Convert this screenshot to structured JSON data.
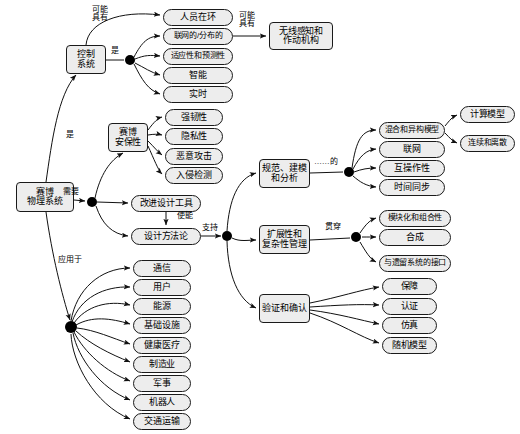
{
  "diagram": {
    "type": "concept-map",
    "style": {
      "node_fill": "#ededed",
      "node_stroke": "#1a1a1a",
      "edge_color": "#1a1a1a",
      "hub_color": "#000000",
      "background": "#ffffff"
    },
    "root": {
      "id": "cps",
      "label": "赛博\n物理系统"
    },
    "nodes": [
      {
        "id": "cps",
        "label": "赛博\n物理系统",
        "x": 16,
        "y": 182,
        "w": 58,
        "h": 30,
        "shape": "rect",
        "fs": 9
      },
      {
        "id": "control",
        "label": "控制\n系统",
        "x": 66,
        "y": 45,
        "w": 40,
        "h": 29,
        "shape": "rect",
        "fs": 9
      },
      {
        "id": "human",
        "label": "人员在环",
        "x": 163,
        "y": 9,
        "w": 70,
        "h": 17,
        "shape": "round",
        "fs": 9
      },
      {
        "id": "networked",
        "label": "联网的/分布的",
        "x": 163,
        "y": 28,
        "w": 70,
        "h": 17,
        "shape": "round",
        "fs": 8
      },
      {
        "id": "adaptive",
        "label": "适应性和预测性",
        "x": 163,
        "y": 48,
        "w": 70,
        "h": 17,
        "shape": "round",
        "fs": 8
      },
      {
        "id": "intelligent",
        "label": "智能",
        "x": 163,
        "y": 67,
        "w": 70,
        "h": 17,
        "shape": "round",
        "fs": 9
      },
      {
        "id": "realtime",
        "label": "实时",
        "x": 163,
        "y": 86,
        "w": 70,
        "h": 17,
        "shape": "round",
        "fs": 9
      },
      {
        "id": "wireless",
        "label": "无线感知和\n作动机构",
        "x": 269,
        "y": 22,
        "w": 64,
        "h": 28,
        "shape": "rect",
        "fs": 9
      },
      {
        "id": "security",
        "label": "赛博\n安保性",
        "x": 108,
        "y": 123,
        "w": 40,
        "h": 29,
        "shape": "rect",
        "fs": 9
      },
      {
        "id": "robust",
        "label": "强韧性",
        "x": 165,
        "y": 109,
        "w": 58,
        "h": 17,
        "shape": "round",
        "fs": 9
      },
      {
        "id": "privacy",
        "label": "隐私性",
        "x": 165,
        "y": 128,
        "w": 58,
        "h": 17,
        "shape": "round",
        "fs": 9
      },
      {
        "id": "attack",
        "label": "恶意攻击",
        "x": 165,
        "y": 148,
        "w": 58,
        "h": 17,
        "shape": "round",
        "fs": 9
      },
      {
        "id": "intrusion",
        "label": "入侵检测",
        "x": 165,
        "y": 167,
        "w": 58,
        "h": 17,
        "shape": "round",
        "fs": 9
      },
      {
        "id": "tools",
        "label": "改进设计工具",
        "x": 131,
        "y": 195,
        "w": 70,
        "h": 17,
        "shape": "round",
        "fs": 9
      },
      {
        "id": "methodology",
        "label": "设计方法论",
        "x": 131,
        "y": 228,
        "w": 70,
        "h": 17,
        "shape": "round",
        "fs": 9
      },
      {
        "id": "spec",
        "label": "规范、建模\n和分析",
        "x": 259,
        "y": 159,
        "w": 51,
        "h": 29,
        "shape": "rect",
        "fs": 9
      },
      {
        "id": "scalability",
        "label": "扩展性和\n复杂性管理",
        "x": 259,
        "y": 225,
        "w": 51,
        "h": 29,
        "shape": "rect",
        "fs": 9
      },
      {
        "id": "verification",
        "label": "验证和确认",
        "x": 259,
        "y": 294,
        "w": 51,
        "h": 29,
        "shape": "rect",
        "fs": 9
      },
      {
        "id": "hybrid",
        "label": "混合和异构模型",
        "x": 379,
        "y": 122,
        "w": 66,
        "h": 17,
        "shape": "round",
        "fs": 8
      },
      {
        "id": "net2",
        "label": "联网",
        "x": 379,
        "y": 141,
        "w": 66,
        "h": 17,
        "shape": "round",
        "fs": 9
      },
      {
        "id": "interop",
        "label": "互操作性",
        "x": 379,
        "y": 160,
        "w": 66,
        "h": 17,
        "shape": "round",
        "fs": 9
      },
      {
        "id": "timesync",
        "label": "时间同步",
        "x": 379,
        "y": 179,
        "w": 66,
        "h": 17,
        "shape": "round",
        "fs": 9
      },
      {
        "id": "compmodel",
        "label": "计算模型",
        "x": 460,
        "y": 106,
        "w": 55,
        "h": 17,
        "shape": "round",
        "fs": 9
      },
      {
        "id": "contdisc",
        "label": "连续和离散",
        "x": 460,
        "y": 135,
        "w": 55,
        "h": 17,
        "shape": "round",
        "fs": 8
      },
      {
        "id": "modular",
        "label": "模块化和组合性",
        "x": 379,
        "y": 210,
        "w": 72,
        "h": 17,
        "shape": "round",
        "fs": 8
      },
      {
        "id": "synthesis",
        "label": "合成",
        "x": 379,
        "y": 229,
        "w": 72,
        "h": 17,
        "shape": "round",
        "fs": 9
      },
      {
        "id": "legacy",
        "label": "与遗留系统的接口",
        "x": 379,
        "y": 255,
        "w": 72,
        "h": 17,
        "shape": "round",
        "fs": 8
      },
      {
        "id": "assurance",
        "label": "保障",
        "x": 382,
        "y": 278,
        "w": 55,
        "h": 17,
        "shape": "round",
        "fs": 9
      },
      {
        "id": "certify",
        "label": "认证",
        "x": 382,
        "y": 298,
        "w": 55,
        "h": 17,
        "shape": "round",
        "fs": 9
      },
      {
        "id": "simulation",
        "label": "仿真",
        "x": 382,
        "y": 317,
        "w": 55,
        "h": 17,
        "shape": "round",
        "fs": 9
      },
      {
        "id": "stochastic",
        "label": "随机模型",
        "x": 382,
        "y": 337,
        "w": 55,
        "h": 17,
        "shape": "round",
        "fs": 9
      },
      {
        "id": "comm",
        "label": "通信",
        "x": 133,
        "y": 260,
        "w": 58,
        "h": 17,
        "shape": "round",
        "fs": 9
      },
      {
        "id": "user",
        "label": "用户",
        "x": 133,
        "y": 279,
        "w": 58,
        "h": 17,
        "shape": "round",
        "fs": 9
      },
      {
        "id": "energy",
        "label": "能源",
        "x": 133,
        "y": 298,
        "w": 58,
        "h": 17,
        "shape": "round",
        "fs": 9
      },
      {
        "id": "infra",
        "label": "基础设施",
        "x": 133,
        "y": 317,
        "w": 58,
        "h": 17,
        "shape": "round",
        "fs": 9
      },
      {
        "id": "health",
        "label": "健康医疗",
        "x": 133,
        "y": 337,
        "w": 58,
        "h": 17,
        "shape": "round",
        "fs": 9
      },
      {
        "id": "manufact",
        "label": "制造业",
        "x": 133,
        "y": 356,
        "w": 58,
        "h": 17,
        "shape": "round",
        "fs": 9
      },
      {
        "id": "military",
        "label": "军事",
        "x": 133,
        "y": 375,
        "w": 58,
        "h": 17,
        "shape": "round",
        "fs": 9
      },
      {
        "id": "robotics",
        "label": "机器人",
        "x": 133,
        "y": 394,
        "w": 58,
        "h": 17,
        "shape": "round",
        "fs": 9
      },
      {
        "id": "transport",
        "label": "交通运输",
        "x": 133,
        "y": 413,
        "w": 58,
        "h": 17,
        "shape": "round",
        "fs": 9
      }
    ],
    "hubs": [
      {
        "id": "hub-control",
        "cx": 130,
        "cy": 60,
        "r": 5
      },
      {
        "id": "hub-needs",
        "cx": 92,
        "cy": 202,
        "r": 5
      },
      {
        "id": "hub-support",
        "cx": 227,
        "cy": 236,
        "r": 5
      },
      {
        "id": "hub-spec",
        "cx": 349,
        "cy": 172,
        "r": 5
      },
      {
        "id": "hub-scale",
        "cx": 356,
        "cy": 237,
        "r": 5
      },
      {
        "id": "hub-apply",
        "cx": 71,
        "cy": 327,
        "r": 6
      }
    ],
    "edge_labels": [
      {
        "id": "el-may-have-1",
        "text": "可能\n具有",
        "x": 92,
        "y": 6,
        "fs": 8
      },
      {
        "id": "el-is-control",
        "text": "是",
        "x": 111,
        "y": 47,
        "fs": 8
      },
      {
        "id": "el-may-have-2",
        "text": "可能\n具有",
        "x": 239,
        "y": 12,
        "fs": 8
      },
      {
        "id": "el-is-root",
        "text": "是",
        "x": 66,
        "y": 131,
        "fs": 8
      },
      {
        "id": "el-needs",
        "text": "需要",
        "x": 63,
        "y": 188,
        "fs": 8
      },
      {
        "id": "el-enables",
        "text": "使能",
        "x": 177,
        "y": 212,
        "fs": 8
      },
      {
        "id": "el-supports",
        "text": "支持",
        "x": 202,
        "y": 224,
        "fs": 8
      },
      {
        "id": "el-applied-to",
        "text": "应用于",
        "x": 58,
        "y": 256,
        "fs": 8
      },
      {
        "id": "el-of",
        "text": "……的",
        "x": 314,
        "y": 158,
        "fs": 8
      },
      {
        "id": "el-through",
        "text": "贯穿",
        "x": 325,
        "y": 223,
        "fs": 8
      }
    ],
    "relations": [
      {
        "from": "cps",
        "to": "control",
        "label": "是"
      },
      {
        "from": "cps",
        "to": "hub-needs",
        "label": "需要"
      },
      {
        "from": "cps",
        "to": "hub-apply",
        "label": "应用于"
      },
      {
        "from": "control",
        "to": "human",
        "label": "可能具有"
      },
      {
        "from": "control",
        "to": "hub-control",
        "label": "是"
      },
      {
        "from": "hub-control",
        "to": "networked",
        "label": ""
      },
      {
        "from": "hub-control",
        "to": "adaptive",
        "label": ""
      },
      {
        "from": "hub-control",
        "to": "intelligent",
        "label": ""
      },
      {
        "from": "hub-control",
        "to": "realtime",
        "label": ""
      },
      {
        "from": "networked",
        "to": "wireless",
        "label": "可能具有"
      },
      {
        "from": "hub-needs",
        "to": "security",
        "label": ""
      },
      {
        "from": "hub-needs",
        "to": "tools",
        "label": ""
      },
      {
        "from": "hub-needs",
        "to": "methodology",
        "label": ""
      },
      {
        "from": "security",
        "to": "robust",
        "label": ""
      },
      {
        "from": "security",
        "to": "privacy",
        "label": ""
      },
      {
        "from": "security",
        "to": "attack",
        "label": ""
      },
      {
        "from": "security",
        "to": "intrusion",
        "label": ""
      },
      {
        "from": "tools",
        "to": "methodology",
        "label": "使能"
      },
      {
        "from": "methodology",
        "to": "hub-support",
        "label": "支持"
      },
      {
        "from": "hub-support",
        "to": "spec",
        "label": ""
      },
      {
        "from": "hub-support",
        "to": "scalability",
        "label": ""
      },
      {
        "from": "hub-support",
        "to": "verification",
        "label": ""
      },
      {
        "from": "spec",
        "to": "hub-spec",
        "label": "……的"
      },
      {
        "from": "hub-spec",
        "to": "hybrid",
        "label": ""
      },
      {
        "from": "hub-spec",
        "to": "net2",
        "label": ""
      },
      {
        "from": "hub-spec",
        "to": "interop",
        "label": ""
      },
      {
        "from": "hub-spec",
        "to": "timesync",
        "label": ""
      },
      {
        "from": "hybrid",
        "to": "compmodel",
        "label": ""
      },
      {
        "from": "hybrid",
        "to": "contdisc",
        "label": ""
      },
      {
        "from": "scalability",
        "to": "hub-scale",
        "label": "贯穿"
      },
      {
        "from": "hub-scale",
        "to": "modular",
        "label": ""
      },
      {
        "from": "hub-scale",
        "to": "synthesis",
        "label": ""
      },
      {
        "from": "hub-scale",
        "to": "legacy",
        "label": ""
      },
      {
        "from": "verification",
        "to": "assurance",
        "label": ""
      },
      {
        "from": "verification",
        "to": "certify",
        "label": ""
      },
      {
        "from": "verification",
        "to": "simulation",
        "label": ""
      },
      {
        "from": "verification",
        "to": "stochastic",
        "label": ""
      },
      {
        "from": "hub-apply",
        "to": "comm",
        "label": ""
      },
      {
        "from": "hub-apply",
        "to": "user",
        "label": ""
      },
      {
        "from": "hub-apply",
        "to": "energy",
        "label": ""
      },
      {
        "from": "hub-apply",
        "to": "infra",
        "label": ""
      },
      {
        "from": "hub-apply",
        "to": "health",
        "label": ""
      },
      {
        "from": "hub-apply",
        "to": "manufact",
        "label": ""
      },
      {
        "from": "hub-apply",
        "to": "military",
        "label": ""
      },
      {
        "from": "hub-apply",
        "to": "robotics",
        "label": ""
      },
      {
        "from": "hub-apply",
        "to": "transport",
        "label": ""
      }
    ],
    "edge_paths": [
      {
        "id": "p-cps-control",
        "d": "M 46,182 C 52,140 58,95 76,75",
        "arrow": true
      },
      {
        "id": "p-cps-hubneeds",
        "d": "M 74,200 L 85,201",
        "arrow": true
      },
      {
        "id": "p-cps-hubapply",
        "d": "M 46,212 C 52,255 62,295 70,320",
        "arrow": true
      },
      {
        "id": "p-ctrl-human",
        "d": "M 86,45 C 88,22 120,10 160,15",
        "arrow": true
      },
      {
        "id": "p-ctrl-hub",
        "d": "M 106,60 L 124,60",
        "arrow": false
      },
      {
        "id": "p-hub-net",
        "d": "M 134,57 C 142,42 148,36 160,36",
        "arrow": true
      },
      {
        "id": "p-hub-adap",
        "d": "M 135,59 C 145,55 150,55 160,56",
        "arrow": true
      },
      {
        "id": "p-hub-intl",
        "d": "M 135,63 C 145,68 150,72 160,75",
        "arrow": true
      },
      {
        "id": "p-hub-rt",
        "d": "M 134,64 C 142,80 148,90 160,94",
        "arrow": true
      },
      {
        "id": "p-net-wireless",
        "d": "M 233,36 L 266,36",
        "arrow": true
      },
      {
        "id": "p-hubn-sec",
        "d": "M 95,198 C 100,175 110,160 123,153",
        "arrow": true
      },
      {
        "id": "p-hubn-tools",
        "d": "M 97,202 L 128,203",
        "arrow": true
      },
      {
        "id": "p-hubn-meth",
        "d": "M 96,206 C 102,224 112,234 128,236",
        "arrow": true
      },
      {
        "id": "p-sec-rob",
        "d": "M 148,130 C 154,122 158,118 162,117",
        "arrow": true
      },
      {
        "id": "p-sec-pri",
        "d": "M 148,135 C 154,134 158,134 162,135",
        "arrow": true
      },
      {
        "id": "p-sec-att",
        "d": "M 148,141 C 154,147 158,152 162,155",
        "arrow": true
      },
      {
        "id": "p-sec-int",
        "d": "M 148,146 C 154,159 158,170 162,174",
        "arrow": true
      },
      {
        "id": "p-tools-meth",
        "d": "M 166,212 L 166,225",
        "arrow": true
      },
      {
        "id": "p-meth-hubs",
        "d": "M 201,236 L 221,236",
        "arrow": true
      },
      {
        "id": "p-hubs-spec",
        "d": "M 227,231 C 229,200 238,178 256,173",
        "arrow": true
      },
      {
        "id": "p-hubs-scale",
        "d": "M 232,238 C 240,242 248,240 256,240",
        "arrow": true
      },
      {
        "id": "p-hubs-ver",
        "d": "M 227,241 C 228,275 238,300 256,308",
        "arrow": true
      },
      {
        "id": "p-spec-hub",
        "d": "M 310,173 L 343,172",
        "arrow": false
      },
      {
        "id": "p-hsp-hyb",
        "d": "M 352,168 C 356,140 362,130 376,130",
        "arrow": true
      },
      {
        "id": "p-hsp-net2",
        "d": "M 353,169 C 360,156 366,150 376,149",
        "arrow": true
      },
      {
        "id": "p-hsp-int",
        "d": "M 354,172 C 362,169 368,168 376,168",
        "arrow": true
      },
      {
        "id": "p-hsp-tsy",
        "d": "M 353,176 C 360,182 366,186 376,187",
        "arrow": true
      },
      {
        "id": "p-hyb-cmp",
        "d": "M 445,126 C 450,120 452,117 457,115",
        "arrow": true
      },
      {
        "id": "p-hyb-cd",
        "d": "M 445,133 C 450,138 452,141 457,143",
        "arrow": true
      },
      {
        "id": "p-scl-hub",
        "d": "M 310,240 L 350,238",
        "arrow": false
      },
      {
        "id": "p-hsc-mod",
        "d": "M 360,233 C 366,224 370,220 376,218",
        "arrow": true
      },
      {
        "id": "p-hsc-syn",
        "d": "M 362,237 C 368,237 372,237 376,237",
        "arrow": true
      },
      {
        "id": "p-hsc-leg",
        "d": "M 360,242 C 366,252 370,259 376,262",
        "arrow": true
      },
      {
        "id": "p-ver-asr",
        "d": "M 310,303 C 340,297 360,290 379,287",
        "arrow": true
      },
      {
        "id": "p-ver-crt",
        "d": "M 310,307 C 340,305 360,304 379,305",
        "arrow": true
      },
      {
        "id": "p-ver-sim",
        "d": "M 310,310 C 340,314 360,320 379,324",
        "arrow": true
      },
      {
        "id": "p-ver-stc",
        "d": "M 310,313 C 340,323 360,337 379,343",
        "arrow": true
      },
      {
        "id": "p-ap-comm",
        "d": "M 71,321 C 76,290 100,268 130,268",
        "arrow": true
      },
      {
        "id": "p-ap-user",
        "d": "M 72,322 C 80,298 104,286 130,287",
        "arrow": true
      },
      {
        "id": "p-ap-energy",
        "d": "M 74,323 C 86,306 108,300 130,305",
        "arrow": true
      },
      {
        "id": "p-ap-infra",
        "d": "M 76,325 C 92,316 110,318 130,324",
        "arrow": true
      },
      {
        "id": "p-ap-health",
        "d": "M 77,328 C 95,330 112,338 130,344",
        "arrow": true
      },
      {
        "id": "p-ap-manu",
        "d": "M 76,331 C 90,344 110,354 130,362",
        "arrow": true
      },
      {
        "id": "p-ap-mil",
        "d": "M 74,332 C 84,352 106,372 130,381",
        "arrow": true
      },
      {
        "id": "p-ap-rob",
        "d": "M 73,333 C 78,358 100,388 130,400",
        "arrow": true
      },
      {
        "id": "p-ap-tran",
        "d": "M 71,334 C 72,362 94,404 130,419",
        "arrow": true
      }
    ]
  }
}
